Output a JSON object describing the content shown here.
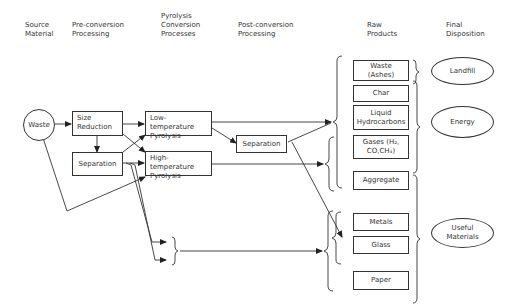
{
  "headers": {
    "source": "Source\nMaterial",
    "pre": "Pre-conversion\nProcessing",
    "pyrolysis": "Pyrolysis\nConversion\nProcesses",
    "post": "Post-conversion\nProcessing",
    "raw": "Raw\nProducts",
    "final": "Final\nDisposition"
  },
  "source": {
    "waste": "Waste"
  },
  "pre": {
    "size_reduction": "Size\nReduction",
    "separation": "Separation"
  },
  "pyrolysis": {
    "low": "Low-temperature\nPyrolysis",
    "high": "High-temperature\nPyrolysis"
  },
  "post": {
    "separation": "Separation"
  },
  "raw_products": {
    "waste_ashes": "Waste\n(Ashes)",
    "char": "Char",
    "liquid": "Liquid\nHydrocarbons",
    "gases": "Gases (H₂,\nCO,CH₄)",
    "aggregate": "Aggregate",
    "metals": "Metals",
    "glass": "Glass",
    "paper": "Paper"
  },
  "final": {
    "landfill": "Landfill",
    "energy": "Energy",
    "useful": "Useful\nMaterials"
  },
  "colors": {
    "line": "#333333",
    "background": "#ffffff"
  }
}
